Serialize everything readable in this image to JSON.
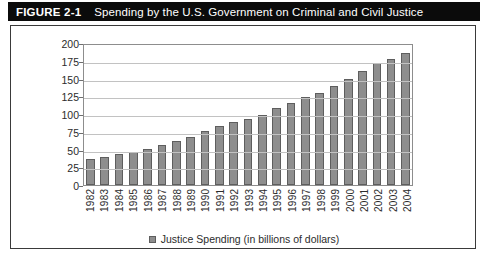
{
  "figure": {
    "number": "FIGURE 2-1",
    "title": "Spending by the U.S. Government on Criminal and Civil Justice"
  },
  "chart_data": {
    "type": "bar",
    "title": "Spending by the U.S. Government on Criminal and Civil Justice",
    "xlabel": "",
    "ylabel": "",
    "ylim": [
      0,
      200
    ],
    "yticks": [
      0,
      25,
      50,
      75,
      100,
      125,
      150,
      175,
      200
    ],
    "grid": true,
    "legend_position": "bottom-center",
    "legend": [
      "Justice Spending (in billions of dollars)"
    ],
    "series_name": "Justice Spending (in billions of dollars)",
    "bar_color": "#8e8e8e",
    "bar_border_color": "#5e5e5e",
    "categories": [
      "1982",
      "1983",
      "1984",
      "1985",
      "1986",
      "1987",
      "1988",
      "1989",
      "1990",
      "1991",
      "1992",
      "1993",
      "1994",
      "1995",
      "1996",
      "1997",
      "1998",
      "1999",
      "2000",
      "2001",
      "2002",
      "2003",
      "2004"
    ],
    "values": [
      36,
      39,
      43,
      47,
      51,
      56,
      62,
      68,
      76,
      83,
      89,
      93,
      99,
      108,
      115,
      124,
      130,
      140,
      149,
      160,
      172,
      177,
      186
    ]
  }
}
